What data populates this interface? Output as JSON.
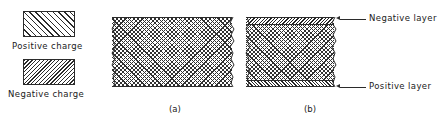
{
  "figure": {
    "background_color": "#ffffff",
    "ink_color": "#2b2b2b",
    "width": 446,
    "height": 124
  },
  "legend": {
    "items": [
      {
        "key": "positive",
        "label": "Positive  charge",
        "hatch": "diagonal-up-right",
        "swatch": {
          "x": 23,
          "y": 11,
          "w": 52,
          "h": 26
        },
        "label_pos": {
          "x": 12,
          "y": 41
        }
      },
      {
        "key": "negative",
        "label": "Negative  charge",
        "hatch": "diagonal-down-right",
        "swatch": {
          "x": 23,
          "y": 59,
          "w": 52,
          "h": 26
        },
        "label_pos": {
          "x": 8,
          "y": 89
        }
      }
    ]
  },
  "slabs": [
    {
      "key": "a",
      "caption": "(a)",
      "caption_pos": {
        "x": 169,
        "y": 104
      },
      "body": {
        "x": 112,
        "y": 17,
        "w": 120,
        "h": 70
      },
      "has_charge_layers": false,
      "ragged_edges": [
        "left",
        "right"
      ]
    },
    {
      "key": "b",
      "caption": "(b)",
      "caption_pos": {
        "x": 304,
        "y": 104
      },
      "body": {
        "x": 246,
        "y": 17,
        "w": 88,
        "h": 70
      },
      "has_charge_layers": true,
      "ragged_edges": [
        "left",
        "right"
      ],
      "layers": [
        {
          "key": "negative",
          "position": "top",
          "thickness": 7
        },
        {
          "key": "positive",
          "position": "bottom",
          "thickness": 7
        }
      ]
    }
  ],
  "annotations": [
    {
      "key": "negative-layer",
      "text": "Negative  layer",
      "text_pos": {
        "x": 369,
        "y": 12
      },
      "leader": {
        "x": 336,
        "y": 19,
        "length": 30
      },
      "arrow_at": "left"
    },
    {
      "key": "positive-layer",
      "text": "Positive  layer",
      "text_pos": {
        "x": 369,
        "y": 80
      },
      "leader": {
        "x": 336,
        "y": 87,
        "length": 30
      },
      "arrow_at": "left"
    }
  ]
}
